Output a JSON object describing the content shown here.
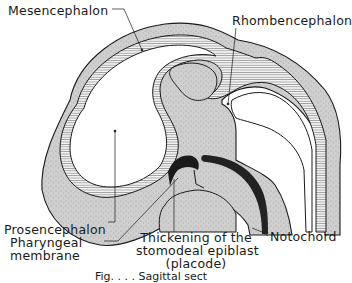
{
  "figure": {
    "labels": {
      "mesencephalon": "Mesencephalon",
      "rhombencephalon": "Rhombencephalon",
      "prosencephalon": "Prosencephalon",
      "pharyngeal_line1": "Pharyngeal",
      "pharyngeal_line2": "membrane",
      "thickening_line1": "Thickening of the",
      "thickening_line2": "stomodeal epiblast",
      "thickening_line3": "(placode)",
      "notochord": "Notochord"
    },
    "caption": "Fig. . . . Sagittal sect",
    "colors": {
      "tissue_fill": "#c9c9c9",
      "outline": "#1a1a1a",
      "notochord": "#222222",
      "background": "#ffffff"
    }
  }
}
